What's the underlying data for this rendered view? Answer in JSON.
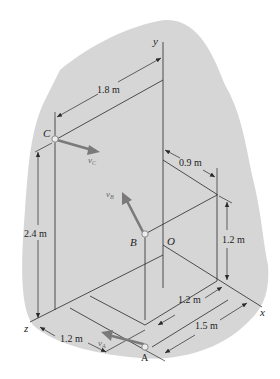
{
  "figure": {
    "background_color": "#d6d6d6",
    "vector_color": "#7a7a7a",
    "line_color": "#2a2a2a",
    "axes": {
      "x": "x",
      "y": "y",
      "z": "z",
      "origin": "O"
    },
    "points": {
      "A": "A",
      "B": "B",
      "C": "C"
    },
    "velocity_labels": {
      "A": {
        "main": "v",
        "sub": "A"
      },
      "B": {
        "main": "v",
        "sub": "B"
      },
      "C": {
        "main": "v",
        "sub": "C"
      }
    },
    "dimensions": {
      "top_width": "1.8 m",
      "right_depth": "0.9 m",
      "left_height": "2.4 m",
      "right_height": "1.2 m",
      "inner_x": "1.2 m",
      "outer_x": "1.5 m",
      "z_offset": "1.2 m"
    }
  }
}
